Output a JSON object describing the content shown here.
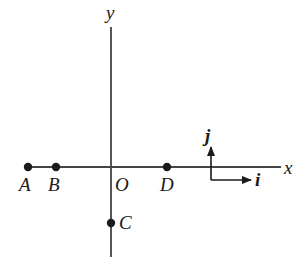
{
  "diagram": {
    "axes": {
      "x_label": "x",
      "y_label": "y",
      "origin_label": "O",
      "color": "#3a3a3a"
    },
    "points": [
      {
        "label": "A",
        "position": "on negative x-axis, far left"
      },
      {
        "label": "B",
        "position": "on negative x-axis, right of A"
      },
      {
        "label": "C",
        "position": "on negative y-axis"
      },
      {
        "label": "D",
        "position": "on positive x-axis"
      }
    ],
    "unit_vectors": {
      "i_label": "i",
      "j_label": "j"
    },
    "labels": {
      "A": "A",
      "B": "B",
      "C": "C",
      "D": "D"
    }
  }
}
